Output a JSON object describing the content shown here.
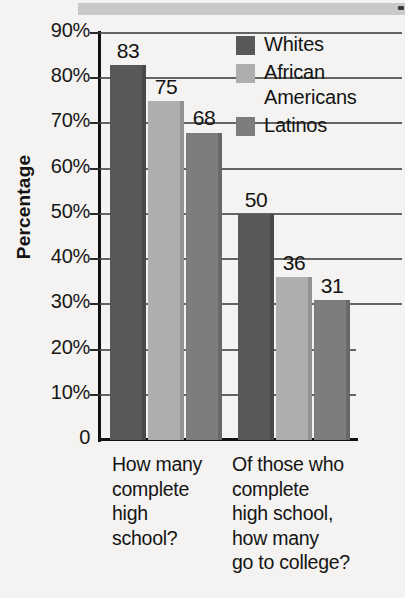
{
  "chart_data": {
    "type": "bar",
    "title": "",
    "xlabel": "",
    "ylabel": "Percentage",
    "ylim": [
      0,
      90
    ],
    "grid": true,
    "legend_position": "top-right",
    "categories": [
      "How many complete high school?",
      "Of those who complete high school, how many go to college?"
    ],
    "series": [
      {
        "name": "Whites",
        "color": "#585858",
        "values": [
          83,
          50
        ]
      },
      {
        "name": "African Americans",
        "color": "#aeaeae",
        "values": [
          75,
          36
        ]
      },
      {
        "name": "Latinos",
        "color": "#7d7d7d",
        "values": [
          68,
          31
        ]
      }
    ],
    "ytick_labels": [
      "90%",
      "80%",
      "70%",
      "60%",
      "50%",
      "40%",
      "30%",
      "20%",
      "10%",
      "0"
    ],
    "ytick_values": [
      90,
      80,
      70,
      60,
      50,
      40,
      30,
      20,
      10,
      0
    ],
    "data_labels": [
      {
        "text": "83"
      },
      {
        "text": "75"
      },
      {
        "text": "68"
      },
      {
        "text": "50"
      },
      {
        "text": "36"
      },
      {
        "text": "31"
      }
    ]
  },
  "axis": {
    "ylabel": "Percentage"
  },
  "legend": {
    "items": [
      {
        "label_line1": "Whites",
        "label_line2": ""
      },
      {
        "label_line1": "African",
        "label_line2": "Americans"
      },
      {
        "label_line1": "Latinos",
        "label_line2": ""
      }
    ]
  },
  "xcategories": [
    {
      "line1": "How many",
      "line2": "complete",
      "line3": "high",
      "line4": "school?",
      "line5": ""
    },
    {
      "line1": "Of those who",
      "line2": "complete",
      "line3": "high school,",
      "line4": "how many",
      "line5": "go to college?"
    }
  ]
}
